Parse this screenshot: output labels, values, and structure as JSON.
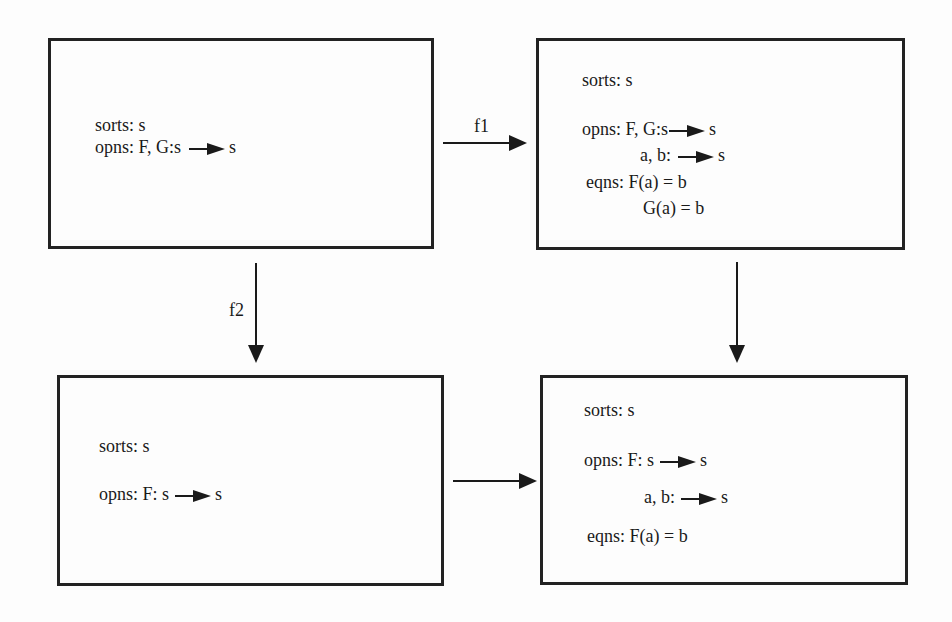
{
  "diagram": {
    "nodes": {
      "top_left": {
        "sorts": "sorts: s",
        "opns_prefix": "opns: F, G:s",
        "opns_suffix": "s"
      },
      "top_right": {
        "sorts": "sorts: s",
        "opns1_prefix": "opns: F, G:s",
        "opns1_suffix": "s",
        "opns2_prefix": "a, b:",
        "opns2_suffix": "s",
        "eqns1": "eqns: F(a) = b",
        "eqns2": "G(a) = b"
      },
      "bottom_left": {
        "sorts": "sorts: s",
        "opns_prefix": "opns: F: s",
        "opns_suffix": "s"
      },
      "bottom_right": {
        "sorts": "sorts: s",
        "opns1_prefix": "opns: F: s",
        "opns1_suffix": "s",
        "opns2_prefix": "a, b:",
        "opns2_suffix": "s",
        "eqns1": "eqns: F(a) = b"
      }
    },
    "edges": {
      "f1": {
        "label": "f1",
        "from": "top_left",
        "to": "top_right"
      },
      "f2": {
        "label": "f2",
        "from": "top_left",
        "to": "bottom_left"
      },
      "right_down": {
        "label": "",
        "from": "top_right",
        "to": "bottom_right"
      },
      "bottom": {
        "label": "",
        "from": "bottom_left",
        "to": "bottom_right"
      }
    },
    "colors": {
      "ink": "#1a1a1a",
      "paper": "#fdfdfd",
      "border": "#222222"
    }
  }
}
